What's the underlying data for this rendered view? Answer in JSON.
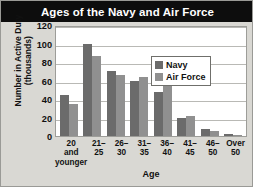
{
  "chart_data": {
    "type": "bar",
    "title": "Ages of the Navy and Air Force",
    "xlabel": "Age",
    "ylabel": "Number in Active Duty (thousands)",
    "categories": [
      "20 and younger",
      "21–25",
      "26–30",
      "31–35",
      "36–40",
      "41–45",
      "46–50",
      "Over 50"
    ],
    "series": [
      {
        "name": "Navy",
        "color": "#6b6b6b",
        "values": [
          44,
          100,
          70,
          59,
          48,
          19,
          8,
          2
        ]
      },
      {
        "name": "Air Force",
        "color": "#909090",
        "values": [
          35,
          87,
          66,
          64,
          61,
          22,
          5,
          1
        ]
      }
    ],
    "ylim": [
      0,
      120
    ],
    "yticks": [
      0,
      20,
      40,
      60,
      80,
      100,
      120
    ],
    "grid": true,
    "legend_position": "inside-top-right"
  },
  "xtick_display": [
    "20\nand\nyounger",
    "21–\n25",
    "26–\n30",
    "31–\n35",
    "36–\n40",
    "41–\n45",
    "46–\n50",
    "Over\n50"
  ],
  "legend": {
    "items": [
      {
        "label": "Navy"
      },
      {
        "label": "Air Force"
      }
    ]
  }
}
